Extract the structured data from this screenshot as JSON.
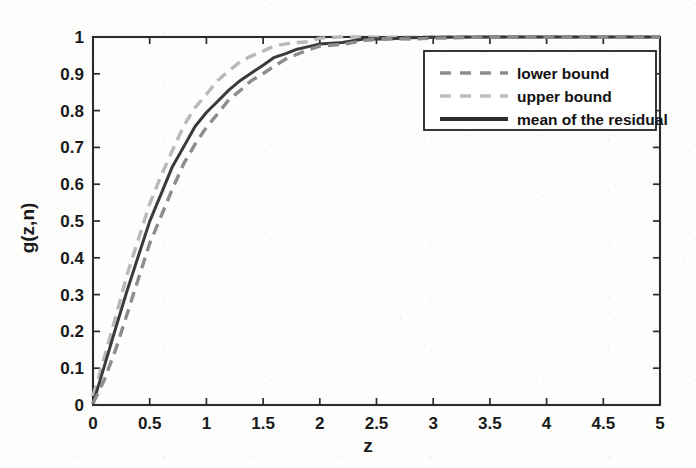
{
  "chart_data": {
    "type": "line",
    "title": "",
    "xlabel": "z",
    "ylabel": "g(z,n)",
    "xlim": [
      0,
      5
    ],
    "ylim": [
      0,
      1
    ],
    "grid": false,
    "legend_position": "upper-right",
    "xticks": [
      "0",
      "0.5",
      "1",
      "1.5",
      "2",
      "2.5",
      "3",
      "3.5",
      "4",
      "4.5",
      "5"
    ],
    "xtick_values": [
      0,
      0.5,
      1,
      1.5,
      2,
      2.5,
      3,
      3.5,
      4,
      4.5,
      5
    ],
    "yticks": [
      "0",
      "0.1",
      "0.2",
      "0.3",
      "0.4",
      "0.5",
      "0.6",
      "0.7",
      "0.8",
      "0.9",
      "1"
    ],
    "ytick_values": [
      0,
      0.1,
      0.2,
      0.3,
      0.4,
      0.5,
      0.6,
      0.7,
      0.8,
      0.9,
      1
    ],
    "x": [
      0,
      0.1,
      0.2,
      0.3,
      0.4,
      0.5,
      0.6,
      0.7,
      0.8,
      0.9,
      1.0,
      1.1,
      1.2,
      1.3,
      1.4,
      1.5,
      1.6,
      1.7,
      1.8,
      1.9,
      2.0,
      2.2,
      2.4,
      2.6,
      2.8,
      3.0,
      3.5,
      4.0,
      4.5,
      5.0
    ],
    "series": [
      {
        "name": "upper bound",
        "style": "dashed",
        "color": "#b9b9b9",
        "values": [
          0.02,
          0.13,
          0.24,
          0.35,
          0.45,
          0.545,
          0.625,
          0.695,
          0.755,
          0.805,
          0.848,
          0.882,
          0.908,
          0.93,
          0.948,
          0.962,
          0.972,
          0.981,
          0.987,
          0.991,
          0.994,
          0.997,
          0.9985,
          0.999,
          0.9995,
          1.0,
          1.0,
          1.0,
          1.0,
          1.0
        ]
      },
      {
        "name": "mean of the residual",
        "style": "solid",
        "color": "#3a3a3a",
        "values": [
          0.0,
          0.105,
          0.21,
          0.31,
          0.405,
          0.495,
          0.575,
          0.645,
          0.705,
          0.755,
          0.795,
          0.828,
          0.855,
          0.878,
          0.902,
          0.925,
          0.944,
          0.958,
          0.968,
          0.975,
          0.981,
          0.989,
          0.994,
          0.996,
          0.998,
          0.999,
          1.0,
          1.0,
          1.0,
          1.0
        ]
      },
      {
        "name": "lower bound",
        "style": "dashed",
        "color": "#8c8c8c",
        "values": [
          0.0,
          0.065,
          0.155,
          0.25,
          0.345,
          0.435,
          0.515,
          0.588,
          0.652,
          0.708,
          0.755,
          0.795,
          0.828,
          0.856,
          0.88,
          0.901,
          0.92,
          0.937,
          0.951,
          0.962,
          0.971,
          0.984,
          0.991,
          0.995,
          0.997,
          0.9985,
          1.0,
          1.0,
          1.0,
          1.0
        ]
      }
    ]
  },
  "legend": {
    "entries": [
      {
        "label": "lower bound",
        "style": "dashed",
        "color": "#8c8c8c"
      },
      {
        "label": "upper bound",
        "style": "dashed",
        "color": "#bdbdbd"
      },
      {
        "label": "mean of the residual",
        "style": "solid",
        "color": "#2e2e2e"
      }
    ]
  },
  "axes": {
    "x_title": "z",
    "y_title": "g(z,n)"
  }
}
